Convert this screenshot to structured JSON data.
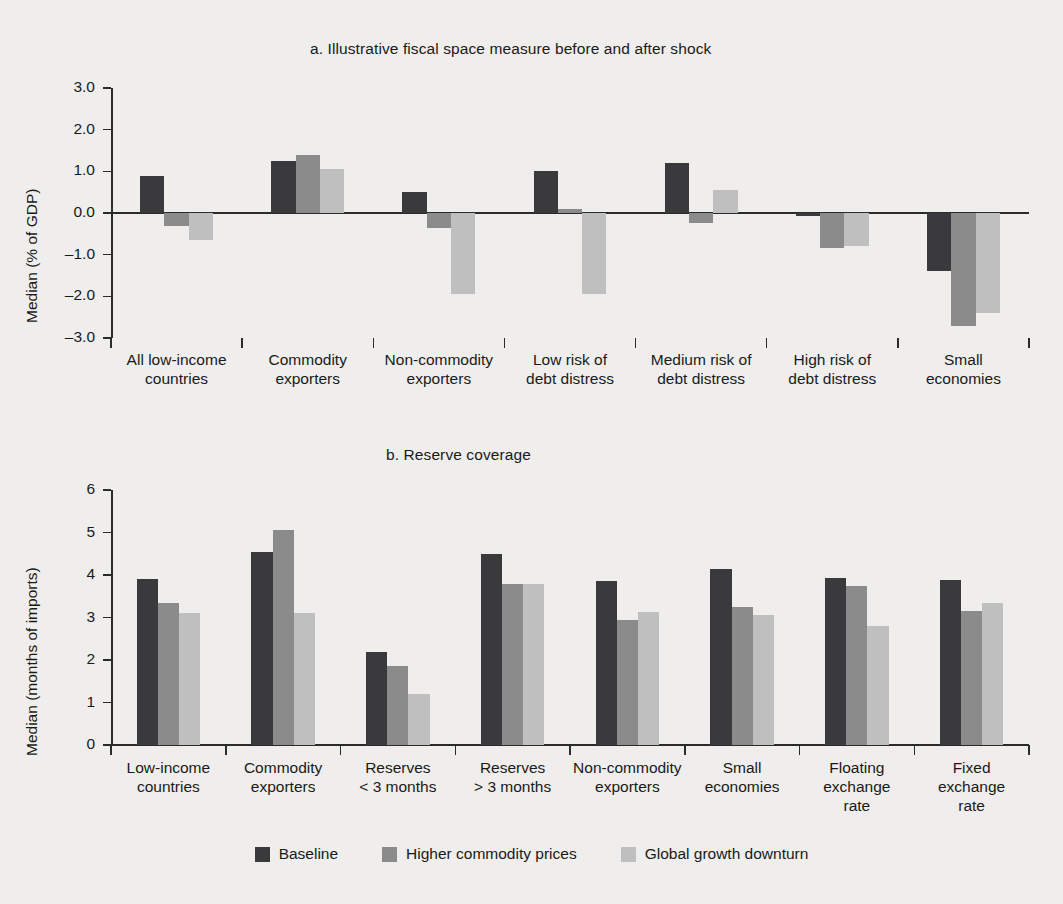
{
  "figure": {
    "background_color": "#efeeec",
    "series_colors": [
      "#3a3a3c",
      "#8b8b8b",
      "#bfbfbf"
    ]
  },
  "legend": {
    "items": [
      {
        "label": "Baseline",
        "color": "#3a3a3c"
      },
      {
        "label": "Higher commodity prices",
        "color": "#8b8b8b"
      },
      {
        "label": "Global growth downturn",
        "color": "#bfbfbf"
      }
    ]
  },
  "chart_data": [
    {
      "type": "bar",
      "title": "a.  Illustrative fiscal space measure before and after shock",
      "xlabel": "",
      "ylabel": "Median (% of GDP)",
      "ylim": [
        -3.0,
        3.0
      ],
      "yticks": [
        "3.0",
        "2.0",
        "1.0",
        "0.0",
        "–1.0",
        "–2.0",
        "–3.0"
      ],
      "ytick_values": [
        3.0,
        2.0,
        1.0,
        0.0,
        -1.0,
        -2.0,
        -3.0
      ],
      "grid": false,
      "legend_position": "bottom",
      "categories": [
        [
          "All low-income",
          "countries"
        ],
        [
          "Commodity",
          "exporters"
        ],
        [
          "Non-commodity",
          "exporters"
        ],
        [
          "Low risk of",
          "debt distress"
        ],
        [
          "Medium risk of",
          "debt distress"
        ],
        [
          "High risk of",
          "debt distress"
        ],
        [
          "Small",
          "economies"
        ]
      ],
      "series": [
        {
          "name": "Baseline",
          "values": [
            0.9,
            1.25,
            0.5,
            1.0,
            1.2,
            -0.08,
            -1.4
          ]
        },
        {
          "name": "Higher commodity prices",
          "values": [
            -0.3,
            1.4,
            -0.35,
            0.1,
            -0.25,
            -0.85,
            -2.7
          ]
        },
        {
          "name": "Global growth downturn",
          "values": [
            -0.65,
            1.05,
            -1.95,
            -1.95,
            0.55,
            -0.78,
            -2.4
          ]
        }
      ]
    },
    {
      "type": "bar",
      "title": "b.  Reserve coverage",
      "xlabel": "",
      "ylabel": "Median (months of imports)",
      "ylim": [
        0,
        6
      ],
      "yticks": [
        "6",
        "5",
        "4",
        "3",
        "2",
        "1",
        "0"
      ],
      "ytick_values": [
        6,
        5,
        4,
        3,
        2,
        1,
        0
      ],
      "grid": false,
      "legend_position": "bottom",
      "categories": [
        [
          "Low-income",
          "countries"
        ],
        [
          "Commodity",
          "exporters"
        ],
        [
          "Reserves",
          "< 3 months"
        ],
        [
          "Reserves",
          "> 3 months"
        ],
        [
          "Non-commodity",
          "exporters"
        ],
        [
          "Small",
          "economies"
        ],
        [
          "Floating",
          "exchange",
          "rate"
        ],
        [
          "Fixed",
          "exchange",
          "rate"
        ]
      ],
      "series": [
        {
          "name": "Baseline",
          "values": [
            3.9,
            4.55,
            2.2,
            4.5,
            3.85,
            4.15,
            3.92,
            3.88
          ]
        },
        {
          "name": "Higher commodity prices",
          "values": [
            3.35,
            5.05,
            1.85,
            3.8,
            2.95,
            3.25,
            3.75,
            3.15
          ]
        },
        {
          "name": "Global growth downturn",
          "values": [
            3.1,
            3.1,
            1.2,
            3.8,
            3.12,
            3.05,
            2.8,
            3.35
          ]
        }
      ]
    }
  ]
}
